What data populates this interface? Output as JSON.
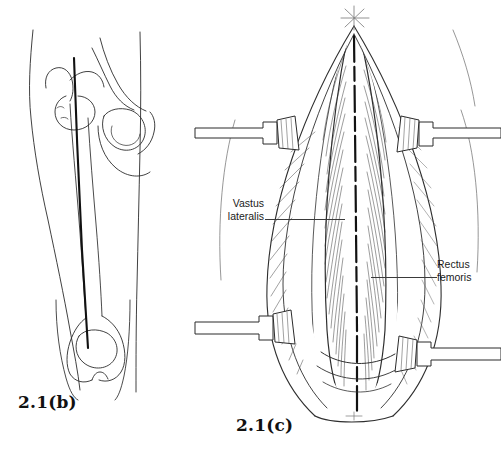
{
  "page": {
    "background_color": "#ffffff",
    "ink_color": "#1b1b1b",
    "kind": "anatomical-line-illustration"
  },
  "figures": [
    {
      "id": "b",
      "caption": "2.1(b)",
      "description": "Outline of thigh and hip with femur and the vertical skin incision line marked over the lateral femoral shaft",
      "parts": [
        "thigh-outline",
        "hip-pelvis-outline",
        "femoral-head",
        "greater-trochanter",
        "femoral-shaft",
        "distal-femur-condyles",
        "patella",
        "incision-line"
      ]
    },
    {
      "id": "c",
      "caption": "2.1(c)",
      "description": "Surgical exposure of the anterolateral thigh showing the split between vastus lateralis and rectus femoris, held open by four retractors",
      "parts": [
        "skin-edges",
        "subcutaneous-fat",
        "fascia-lata-edges",
        "muscle-bellies",
        "retractor-upper-left",
        "retractor-upper-right",
        "retractor-lower-left",
        "retractor-lower-right",
        "apex-suture-mark"
      ]
    }
  ],
  "annotations": {
    "vastus": {
      "line1": "Vastus",
      "line2": "lateralis"
    },
    "rectus": {
      "line1": "Rectus",
      "line2": "femoris"
    }
  }
}
